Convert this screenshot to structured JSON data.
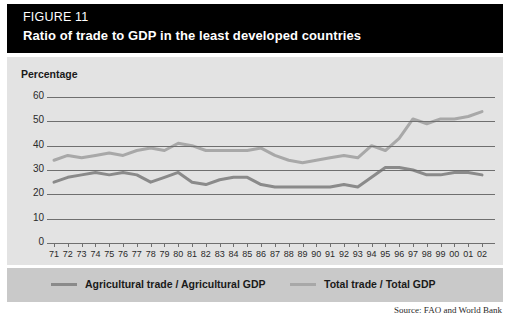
{
  "figure": {
    "number_label": "FIGURE 11",
    "title": "Ratio of trade to GDP in the least developed countries",
    "source": "Source: FAO and World Bank",
    "axis_label": "Percentage"
  },
  "legend": {
    "items": [
      {
        "label": "Agricultural trade / Agricultural GDP",
        "color": "#8a8a8a"
      },
      {
        "label": "Total trade / Total GDP",
        "color": "#a8a8a8"
      }
    ]
  },
  "colors": {
    "title_bar": "#000000",
    "panel": "#e3e3e3",
    "legend_bar": "#c9c9c9",
    "grid": "#6f6f6f",
    "series_agricultural": "#8a8a8a",
    "series_total": "#a8a8a8"
  },
  "chart_data": {
    "type": "line",
    "title": "Ratio of trade to GDP in the least developed countries",
    "xlabel": "",
    "ylabel": "Percentage",
    "ylim": [
      0,
      60
    ],
    "yticks": [
      0,
      10,
      20,
      30,
      40,
      50,
      60
    ],
    "grid": true,
    "legend_position": "bottom",
    "categories": [
      "71",
      "72",
      "73",
      "74",
      "75",
      "76",
      "77",
      "78",
      "79",
      "80",
      "81",
      "82",
      "83",
      "84",
      "85",
      "86",
      "87",
      "88",
      "89",
      "90",
      "91",
      "92",
      "93",
      "94",
      "95",
      "96",
      "97",
      "98",
      "99",
      "00",
      "01",
      "02"
    ],
    "series": [
      {
        "name": "Total trade / Total GDP",
        "color": "#a8a8a8",
        "values": [
          34,
          36,
          35,
          36,
          37,
          36,
          38,
          39,
          38,
          41,
          40,
          38,
          38,
          38,
          38,
          39,
          36,
          34,
          33,
          34,
          35,
          36,
          35,
          40,
          38,
          43,
          51,
          49,
          51,
          51,
          52,
          54
        ]
      },
      {
        "name": "Agricultural trade / Agricultural GDP",
        "color": "#8a8a8a",
        "values": [
          25,
          27,
          28,
          29,
          28,
          29,
          28,
          25,
          27,
          29,
          25,
          24,
          26,
          27,
          27,
          24,
          23,
          23,
          23,
          23,
          23,
          24,
          23,
          27,
          31,
          31,
          30,
          28,
          28,
          29,
          29,
          28
        ]
      }
    ]
  }
}
